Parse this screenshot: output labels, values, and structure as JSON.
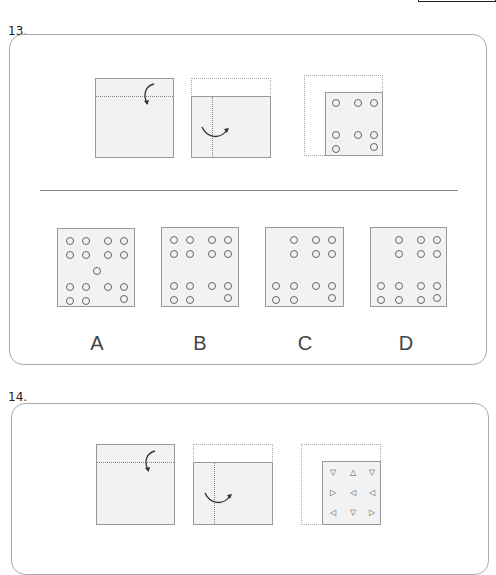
{
  "questions": [
    {
      "number": "13.",
      "steps": [
        {
          "step": 1,
          "fold": "horizontal",
          "arrow": "fold-down"
        },
        {
          "step": 2,
          "fold": "vertical",
          "arrow": "fold-right"
        },
        {
          "step": 3,
          "punched_symbol": "circle",
          "rows": [
            [
              1,
              1,
              1
            ],
            [
              0,
              0,
              0
            ],
            [
              1,
              1,
              1
            ],
            [
              1,
              0,
              1
            ]
          ]
        }
      ],
      "options": [
        {
          "label": "A",
          "symbol": "circle"
        },
        {
          "label": "B",
          "symbol": "circle"
        },
        {
          "label": "C",
          "symbol": "circle"
        },
        {
          "label": "D",
          "symbol": "circle"
        }
      ]
    },
    {
      "number": "14.",
      "steps": [
        {
          "step": 1,
          "fold": "horizontal",
          "arrow": "fold-down"
        },
        {
          "step": 2,
          "fold": "vertical",
          "arrow": "fold-right"
        },
        {
          "step": 3,
          "punched_symbol": "triangle",
          "grid": [
            [
              "▽",
              "△",
              "▽"
            ],
            [
              "▷",
              "◁",
              "◁"
            ],
            [
              "◁",
              "▽",
              "▷"
            ]
          ]
        }
      ]
    }
  ]
}
